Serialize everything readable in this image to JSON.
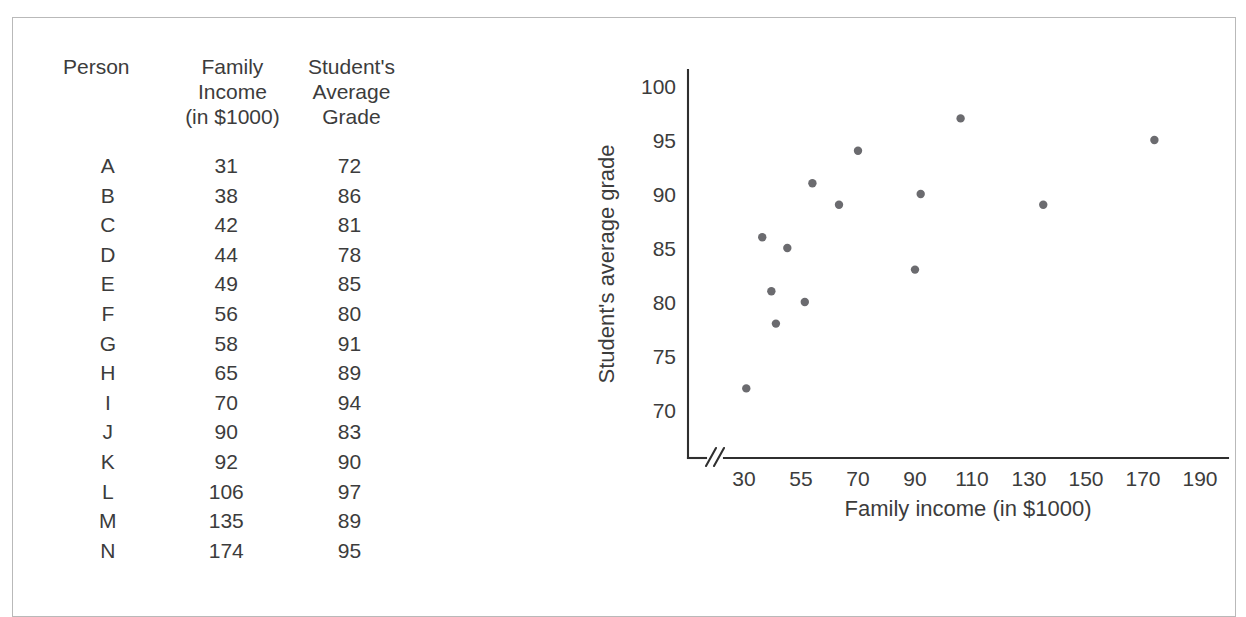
{
  "table": {
    "headers": [
      "Person",
      "Family\nIncome\n(in $1000)",
      "Student's\nAverage\nGrade"
    ],
    "rows": [
      {
        "person": "A",
        "income": "31",
        "grade": "72"
      },
      {
        "person": "B",
        "income": "38",
        "grade": "86"
      },
      {
        "person": "C",
        "income": "42",
        "grade": "81"
      },
      {
        "person": "D",
        "income": "44",
        "grade": "78"
      },
      {
        "person": "E",
        "income": "49",
        "grade": "85"
      },
      {
        "person": "F",
        "income": "56",
        "grade": "80"
      },
      {
        "person": "G",
        "income": "58",
        "grade": "91"
      },
      {
        "person": "H",
        "income": "65",
        "grade": "89"
      },
      {
        "person": "I",
        "income": "70",
        "grade": "94"
      },
      {
        "person": "J",
        "income": "90",
        "grade": "83"
      },
      {
        "person": "K",
        "income": "92",
        "grade": "90"
      },
      {
        "person": "L",
        "income": "106",
        "grade": "97"
      },
      {
        "person": "M",
        "income": "135",
        "grade": "89"
      },
      {
        "person": "N",
        "income": "174",
        "grade": "95"
      }
    ]
  },
  "chart_data": {
    "type": "scatter",
    "title": "",
    "xlabel": "Family income (in $1000)",
    "ylabel": "Student's average grade",
    "x_tick_labels": [
      "30",
      "55",
      "70",
      "90",
      "110",
      "130",
      "150",
      "170",
      "190"
    ],
    "x_tick_values": [
      30,
      55,
      70,
      90,
      110,
      130,
      150,
      170,
      190
    ],
    "y_tick_labels": [
      "70",
      "75",
      "80",
      "85",
      "90",
      "95",
      "100"
    ],
    "y_tick_values": [
      70,
      75,
      80,
      85,
      90,
      95,
      100
    ],
    "ylim": [
      67,
      100
    ],
    "grid": false,
    "legend": false,
    "axis_break": true,
    "axis_break_symbol": "//",
    "point_color": "#6b6b6f",
    "points": [
      {
        "label": "A",
        "x": 31,
        "y": 72
      },
      {
        "label": "B",
        "x": 38,
        "y": 86
      },
      {
        "label": "C",
        "x": 42,
        "y": 81
      },
      {
        "label": "D",
        "x": 44,
        "y": 78
      },
      {
        "label": "E",
        "x": 49,
        "y": 85
      },
      {
        "label": "F",
        "x": 56,
        "y": 80
      },
      {
        "label": "G",
        "x": 58,
        "y": 91
      },
      {
        "label": "H",
        "x": 65,
        "y": 89
      },
      {
        "label": "I",
        "x": 70,
        "y": 94
      },
      {
        "label": "J",
        "x": 90,
        "y": 83
      },
      {
        "label": "K",
        "x": 92,
        "y": 90
      },
      {
        "label": "L",
        "x": 106,
        "y": 97
      },
      {
        "label": "M",
        "x": 135,
        "y": 89
      },
      {
        "label": "N",
        "x": 174,
        "y": 95
      }
    ]
  }
}
